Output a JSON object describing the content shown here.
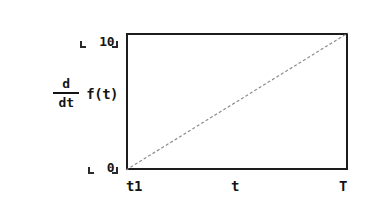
{
  "figure": {
    "background_color": "#ffffff",
    "ink_color": "#141414",
    "series_color": "#8c8c8c"
  },
  "axes": {
    "y_label": {
      "numerator": "d",
      "denominator": "dt",
      "function": "f(t)",
      "full": "d/dt f(t)"
    },
    "y_ticks": [
      {
        "label": "0"
      },
      {
        "label": "10"
      }
    ],
    "x_ticks": [
      {
        "label": "t1"
      },
      {
        "label": "t"
      },
      {
        "label": "T"
      }
    ]
  },
  "chart_data": {
    "type": "line",
    "title": "",
    "subtitle": "",
    "xlabel": "t",
    "ylabel": "d/dt f(t)",
    "x": [
      0,
      1
    ],
    "series": [
      {
        "name": "d/dt f(t)",
        "values": [
          0,
          10
        ],
        "style": "dashed",
        "color": "#8c8c8c",
        "linewidth": 1
      }
    ],
    "xlim": [
      0,
      1
    ],
    "ylim": [
      0,
      10
    ],
    "xtick_labels": [
      "t1",
      "t",
      "T"
    ],
    "xtick_positions": [
      0,
      0.5,
      1
    ],
    "ytick_labels": [
      "0",
      "10"
    ],
    "ytick_positions": [
      0,
      10
    ],
    "grid": false,
    "legend": false,
    "legend_position": "none",
    "annotations": []
  }
}
